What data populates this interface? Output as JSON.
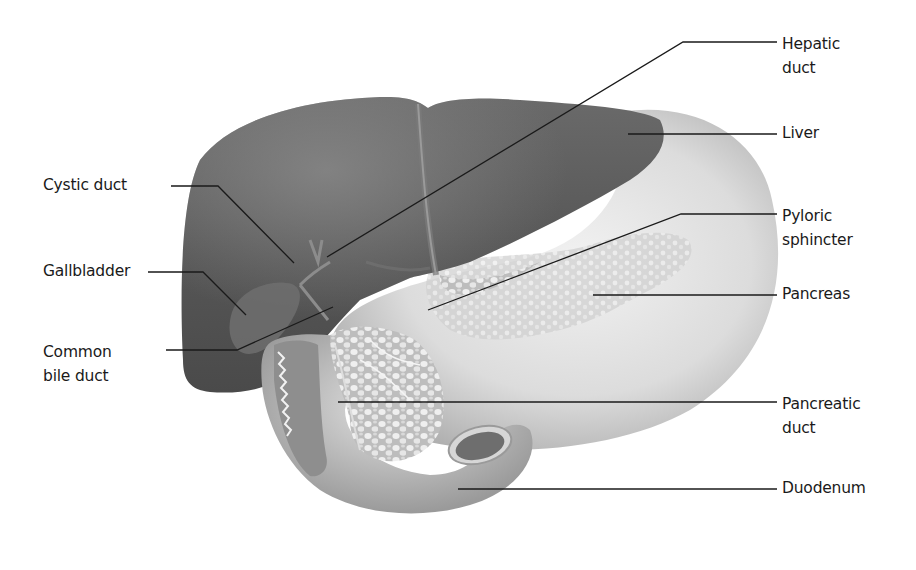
{
  "figure": {
    "style": "grayscale anatomical illustration with leader-line labels"
  },
  "labels": {
    "left": [
      {
        "id": "cystic-duct",
        "lines": [
          "Cystic duct"
        ]
      },
      {
        "id": "gallbladder",
        "lines": [
          "Gallbladder"
        ]
      },
      {
        "id": "common-bile-duct",
        "lines": [
          "Common",
          "bile duct"
        ]
      }
    ],
    "right": [
      {
        "id": "hepatic-duct",
        "lines": [
          "Hepatic",
          "duct"
        ]
      },
      {
        "id": "liver",
        "lines": [
          "Liver"
        ]
      },
      {
        "id": "pyloric-sphincter",
        "lines": [
          "Pyloric",
          "sphincter"
        ]
      },
      {
        "id": "pancreas",
        "lines": [
          "Pancreas"
        ]
      },
      {
        "id": "pancreatic-duct",
        "lines": [
          "Pancreatic",
          "duct"
        ]
      },
      {
        "id": "duodenum",
        "lines": [
          "Duodenum"
        ]
      }
    ]
  },
  "colors": {
    "background": "#ffffff",
    "liver": "#555555",
    "stomach": "#d8d8d8",
    "pancreas": "#cfcfcf",
    "leader_line": "#1a1a1a",
    "text": "#1a1a1a"
  }
}
